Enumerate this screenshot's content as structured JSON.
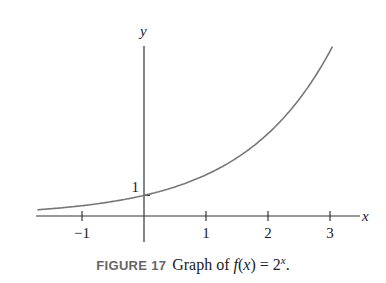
{
  "chart_data": {
    "type": "line",
    "title": "",
    "function": "f(x) = 2^x",
    "xlabel": "x",
    "ylabel": "y",
    "xlim": [
      -1.7,
      3.4
    ],
    "ylim": [
      -1.2,
      8.6
    ],
    "x_ticks": [
      -1,
      1,
      2,
      3
    ],
    "x_tick_labels": [
      "−1",
      "1",
      "2",
      "3"
    ],
    "y_ticks": [
      1
    ],
    "y_tick_labels": [
      "1"
    ],
    "series": [
      {
        "name": "f(x)=2^x",
        "color": "#777777",
        "x": [
          -1.7,
          -1,
          0,
          1,
          2,
          3,
          3.05
        ],
        "y": [
          0.31,
          0.5,
          1,
          2,
          4,
          8,
          8.28
        ]
      }
    ],
    "grid": false,
    "legend": null
  },
  "caption": {
    "figure_label": "FIGURE 17",
    "text_prefix": "Graph of ",
    "fx": "f",
    "paren_open": "(",
    "x": "x",
    "paren_close": ")",
    "eq": " = 2",
    "exp": "x",
    "end": "."
  }
}
